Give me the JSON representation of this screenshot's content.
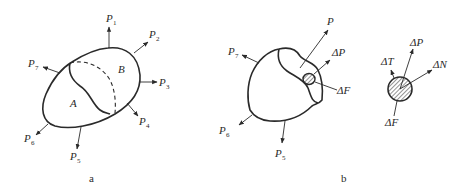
{
  "figure_a": {
    "caption": "a",
    "regions": {
      "A": "A",
      "B": "B"
    },
    "forces": [
      {
        "base": "P",
        "sub": "1"
      },
      {
        "base": "P",
        "sub": "2"
      },
      {
        "base": "P",
        "sub": "3"
      },
      {
        "base": "P",
        "sub": "4"
      },
      {
        "base": "P",
        "sub": "5"
      },
      {
        "base": "P",
        "sub": "6"
      },
      {
        "base": "P",
        "sub": "7"
      }
    ]
  },
  "figure_b": {
    "caption": "b",
    "forces": [
      {
        "base": "P",
        "sub": "5"
      },
      {
        "base": "P",
        "sub": "6"
      },
      {
        "base": "P",
        "sub": "7"
      }
    ],
    "resultant": "P",
    "delta_p": "ΔP",
    "delta_f": "ΔF"
  },
  "figure_detail": {
    "delta_t": "ΔT",
    "delta_p": "ΔP",
    "delta_n": "ΔN",
    "delta_f": "ΔF"
  },
  "colors": {
    "ink": "#2a2a2a",
    "background": "#ffffff"
  }
}
